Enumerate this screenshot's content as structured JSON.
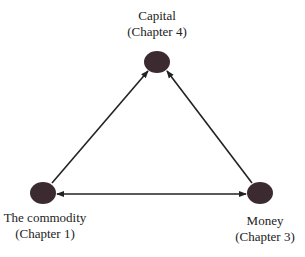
{
  "diagram": {
    "nodes": [
      {
        "id": "capital",
        "name": "Capital",
        "chapter": "(Chapter 4)"
      },
      {
        "id": "commodity",
        "name": "The commodity",
        "chapter": "(Chapter 1)"
      },
      {
        "id": "money",
        "name": "Money",
        "chapter": "(Chapter 3)"
      }
    ],
    "edges": [
      {
        "from": "commodity",
        "to": "capital",
        "direction": "forward"
      },
      {
        "from": "money",
        "to": "capital",
        "direction": "forward"
      },
      {
        "from": "commodity",
        "to": "money",
        "direction": "both"
      }
    ],
    "colors": {
      "node": "#3b2b31",
      "edge": "#222222"
    }
  }
}
